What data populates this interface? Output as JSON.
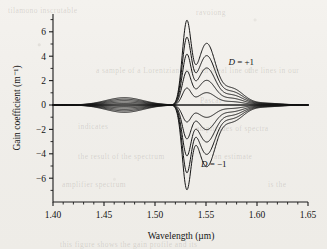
{
  "figure": {
    "background_color": "#f2f0ec",
    "ink_color": "#141414",
    "ghost_text": [
      {
        "text": "tilamono inscrutable",
        "x": 8,
        "y": 6
      },
      {
        "text": "ravoiong",
        "x": 196,
        "y": 8
      },
      {
        "text": "a sample of a Lorentzian from an ideal line of",
        "x": 96,
        "y": 66
      },
      {
        "text": "the lines in our",
        "x": 248,
        "y": 66
      },
      {
        "text": "Pascal",
        "x": 200,
        "y": 96
      },
      {
        "text": "indicates",
        "x": 78,
        "y": 122
      },
      {
        "text": "amplitudes of spectra",
        "x": 196,
        "y": 124
      },
      {
        "text": "the result of the spectrum",
        "x": 78,
        "y": 152
      },
      {
        "text": "an estimate",
        "x": 214,
        "y": 152
      },
      {
        "text": "amplifier spectrum",
        "x": 62,
        "y": 180
      },
      {
        "text": "is the",
        "x": 268,
        "y": 180
      },
      {
        "text": "this figure shows the gain profile and its",
        "x": 60,
        "y": 240
      }
    ]
  },
  "chart_data": {
    "type": "line",
    "title": "",
    "xlabel": "Wavelength (µm)",
    "ylabel": "Gain coefficient (m⁻¹)",
    "xlim": [
      1.4,
      1.65
    ],
    "ylim": [
      -7.4,
      7.0
    ],
    "grid": false,
    "legend": "none",
    "x_ticks": [
      1.4,
      1.45,
      1.5,
      1.55,
      1.6,
      1.65
    ],
    "x_tick_labels": [
      "1.40",
      "1.45",
      "1.50",
      "1.55",
      "1.60",
      "1.65"
    ],
    "x_minor_step": 0.01,
    "y_ticks": [
      6,
      4,
      2,
      0,
      -2,
      -4,
      -6
    ],
    "y_tick_labels": [
      "6",
      "4",
      "2",
      "0",
      "−2",
      "−4",
      "−6"
    ],
    "y_minor_step": 1,
    "annotations": [
      {
        "text_prefix": "D",
        "text_rest": " = +1",
        "x": 1.572,
        "y": 3.3,
        "name": "d-plus-one-label"
      },
      {
        "text_prefix": "D",
        "text_rest": " = −1",
        "x": 1.545,
        "y": -5.1,
        "name": "d-minus-one-label"
      }
    ],
    "series_parameter": "D",
    "series_values": [
      1.0,
      0.8,
      0.6,
      0.4,
      0.2,
      0.0,
      -0.2,
      -0.4,
      -0.6,
      -0.8,
      -1.0
    ],
    "peak1_center_um": 1.531,
    "peak1_amplitude_max": 6.55,
    "peak2_center_um": 1.551,
    "peak2_amplitude_max": 4.5,
    "shoulder_center_um": 1.5775,
    "shoulder_amplitude_max": 1.05,
    "left_tail_center_um": 1.47,
    "left_tail_amplitude_max": -0.6
  }
}
